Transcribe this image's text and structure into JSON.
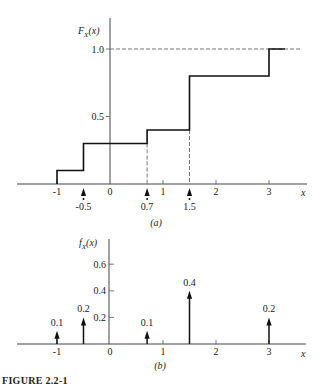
{
  "figure_label": "FIGURE 2.2-1",
  "chart_data": [
    {
      "type": "line",
      "subtype": "step-cdf",
      "panel_label": "(a)",
      "ylabel": "F_X(x)",
      "ylabel_parts": {
        "main": "F",
        "sub": "X",
        "arg": "(x)"
      },
      "xlabel": "x",
      "xlim": [
        -2,
        3.6
      ],
      "ylim": [
        0,
        1.0
      ],
      "x_ticks": [
        -1,
        0,
        1,
        2,
        3
      ],
      "x_tick_labels": [
        "-1",
        "0",
        "1",
        "2",
        "3"
      ],
      "y_ticks": [
        0.5,
        1.0
      ],
      "y_tick_labels": [
        "0.5",
        "1.0"
      ],
      "reference_line_y": 1.0,
      "steps": [
        {
          "x_start": -1,
          "x_end": -0.5,
          "y": 0.1
        },
        {
          "x_start": -0.5,
          "x_end": 0.7,
          "y": 0.3
        },
        {
          "x_start": 0.7,
          "x_end": 1.5,
          "y": 0.4
        },
        {
          "x_start": 1.5,
          "x_end": 3,
          "y": 0.8
        },
        {
          "x_start": 3,
          "x_end": 3.3,
          "y": 1.0
        }
      ],
      "jump_markers": [
        {
          "x": -0.5,
          "label": "-0.5"
        },
        {
          "x": 0.7,
          "label": "0.7"
        },
        {
          "x": 1.5,
          "label": "1.5"
        }
      ]
    },
    {
      "type": "bar",
      "subtype": "impulse-pmf",
      "panel_label": "(b)",
      "ylabel": "f_X(x)",
      "ylabel_parts": {
        "main": "f",
        "sub": "X",
        "arg": "(x)"
      },
      "xlabel": "x",
      "xlim": [
        -2,
        3.6
      ],
      "ylim": [
        0,
        0.7
      ],
      "x_ticks": [
        -1,
        0,
        1,
        2,
        3
      ],
      "x_tick_labels": [
        "-1",
        "0",
        "1",
        "2",
        "3"
      ],
      "y_ticks": [
        0.2,
        0.4,
        0.6
      ],
      "y_tick_labels": [
        "0.2",
        "0.4",
        "0.6"
      ],
      "impulses": [
        {
          "x": -1,
          "value": 0.1,
          "label": "0.1"
        },
        {
          "x": -0.5,
          "value": 0.2,
          "label": "0.2"
        },
        {
          "x": 0.7,
          "value": 0.1,
          "label": "0.1"
        },
        {
          "x": 1.5,
          "value": 0.4,
          "label": "0.4"
        },
        {
          "x": 3,
          "value": 0.2,
          "label": "0.2"
        }
      ]
    }
  ]
}
